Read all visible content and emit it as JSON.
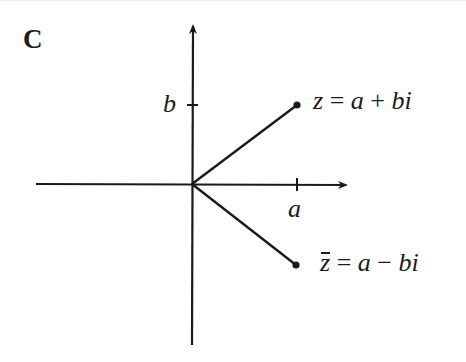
{
  "figure": {
    "panel_label": "C",
    "axes": {
      "origin": [
        192,
        184
      ],
      "horizontal": {
        "from_x": 36,
        "to_x": 348,
        "arrow": "right"
      },
      "vertical": {
        "from_y": 345,
        "to_y": 24,
        "arrow": "up"
      }
    },
    "ticks": {
      "b_tick_label": "b",
      "a_tick_label": "a"
    },
    "points": [
      {
        "name": "z",
        "label_var": "z",
        "label_eq": " = ",
        "label_a": "a",
        "label_op": " + ",
        "label_b": "bi",
        "position": [
          297,
          105
        ]
      },
      {
        "name": "z-conjugate",
        "label_var": "z",
        "label_eq": " = ",
        "label_a": "a",
        "label_op": " − ",
        "label_b": "bi",
        "position": [
          296,
          265
        ]
      }
    ],
    "colors": {
      "ink": "#1a1a1a",
      "background": "#ffffff"
    }
  }
}
